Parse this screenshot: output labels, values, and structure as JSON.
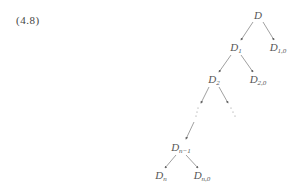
{
  "equation_label": "(4.8)",
  "tree": {
    "nodes": [
      {
        "id": "D",
        "base": "D",
        "sub": "",
        "x": 258,
        "y": 15
      },
      {
        "id": "D1",
        "base": "D",
        "sub": "1",
        "x": 236,
        "y": 48
      },
      {
        "id": "D10",
        "base": "D",
        "sub": "1,0",
        "x": 278,
        "y": 48
      },
      {
        "id": "D2",
        "base": "D",
        "sub": "2",
        "x": 214,
        "y": 80
      },
      {
        "id": "D20",
        "base": "D",
        "sub": "2,0",
        "x": 258,
        "y": 80
      },
      {
        "id": "Dn1",
        "base": "D",
        "sub": "n−1",
        "x": 181,
        "y": 148
      },
      {
        "id": "Dn",
        "base": "D",
        "sub": "n",
        "x": 161,
        "y": 176
      },
      {
        "id": "Dn0",
        "base": "D",
        "sub": "n,0",
        "x": 202,
        "y": 176
      }
    ],
    "ellipsis": "⋮"
  }
}
